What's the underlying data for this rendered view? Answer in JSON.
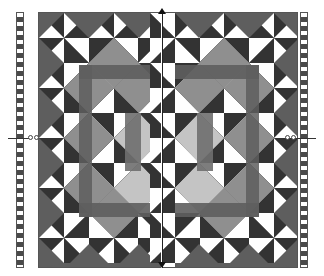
{
  "canvas": {
    "description": "Quilt pattern design canvas with mirror axis",
    "colors": {
      "dark": "#333333",
      "medium_dark": "#5e5e5e",
      "medium": "#8f8f8f",
      "light": "#c4c4c4",
      "white": "#ffffff",
      "border": "#555555"
    }
  },
  "quilt": {
    "grid_columns": 5,
    "grid_rows": 5,
    "mirror_axis": "vertical-center"
  },
  "rulers": {
    "left": "vertical-ruler-left",
    "right": "vertical-ruler-right"
  },
  "handles": {
    "left_count": 2,
    "right_count": 2
  }
}
